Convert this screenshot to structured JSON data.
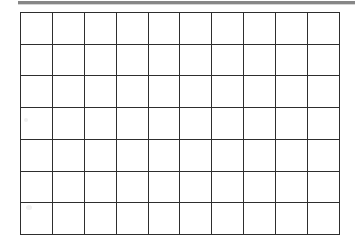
{
  "page": {
    "background_color": "#ffffff",
    "width": 355,
    "height": 251
  },
  "top_bar": {
    "name": "top-edge-rule",
    "color": "#878787",
    "shadow_color": "#d4d4d4"
  },
  "grid": {
    "title": "",
    "columns": 10,
    "rows": 7,
    "line_color": "#2e2e2e",
    "line_width_px": 1.6,
    "cell_fill": "#ffffff",
    "column_headers": [
      "",
      "",
      "",
      "",
      "",
      "",
      "",
      "",
      "",
      ""
    ],
    "cells": [
      [
        "",
        "",
        "",
        "",
        "",
        "",
        "",
        "",
        "",
        ""
      ],
      [
        "",
        "",
        "",
        "",
        "",
        "",
        "",
        "",
        "",
        ""
      ],
      [
        "",
        "",
        "",
        "",
        "",
        "",
        "",
        "",
        "",
        ""
      ],
      [
        "",
        "",
        "",
        "",
        "",
        "",
        "",
        "",
        "",
        ""
      ],
      [
        "",
        "",
        "",
        "",
        "",
        "",
        "",
        "",
        "",
        ""
      ],
      [
        "",
        "",
        "",
        "",
        "",
        "",
        "",
        "",
        "",
        ""
      ],
      [
        "",
        "",
        "",
        "",
        "",
        "",
        "",
        "",
        "",
        ""
      ]
    ]
  }
}
